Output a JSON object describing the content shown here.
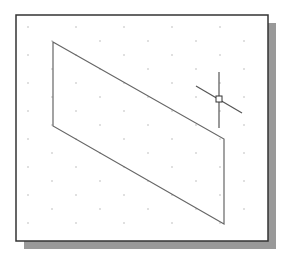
{
  "viewport": {
    "frame": {
      "x": 16,
      "y": 15,
      "width": 252,
      "height": 226,
      "border_color": "#333333",
      "shadow_color": "#999999",
      "shadow_offset": 8
    },
    "grid": {
      "dot_color": "#aaaaaa",
      "spacing_x": 48,
      "spacing_y": 28,
      "row_offset_y": 14,
      "row_offset_x": 24,
      "origin_x": 28,
      "origin_y": 27
    },
    "parallelogram": {
      "points": [
        [
          53,
          42
        ],
        [
          224,
          139
        ],
        [
          224,
          224
        ],
        [
          53,
          126
        ]
      ],
      "stroke": "#666666"
    },
    "crosshair": {
      "center": [
        219,
        99
      ],
      "vertical": [
        [
          219,
          72
        ],
        [
          219,
          128
        ]
      ],
      "diagonal": [
        [
          196,
          86
        ],
        [
          242,
          113
        ]
      ],
      "pickbox_size": 6,
      "stroke": "#555555"
    }
  }
}
